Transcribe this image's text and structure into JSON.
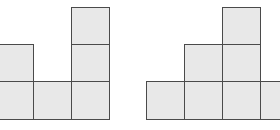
{
  "colors": {
    "fill": "#e8e8e8",
    "stroke": "#4a4a4a",
    "background": "#ffffff"
  },
  "figures": [
    {
      "name": "left-figure",
      "column_heights": [
        2,
        1,
        3
      ],
      "cells": [
        {
          "x": -5,
          "y": 44
        },
        {
          "x": -5,
          "y": 81
        },
        {
          "x": 33,
          "y": 81
        },
        {
          "x": 71,
          "y": 7
        },
        {
          "x": 71,
          "y": 44
        },
        {
          "x": 71,
          "y": 81
        }
      ]
    },
    {
      "name": "right-figure",
      "column_heights": [
        1,
        2,
        3,
        1
      ],
      "cells": [
        {
          "x": 146,
          "y": 81
        },
        {
          "x": 184,
          "y": 44
        },
        {
          "x": 184,
          "y": 81
        },
        {
          "x": 222,
          "y": 7
        },
        {
          "x": 222,
          "y": 44
        },
        {
          "x": 222,
          "y": 81
        },
        {
          "x": 260,
          "y": 81
        }
      ]
    }
  ]
}
